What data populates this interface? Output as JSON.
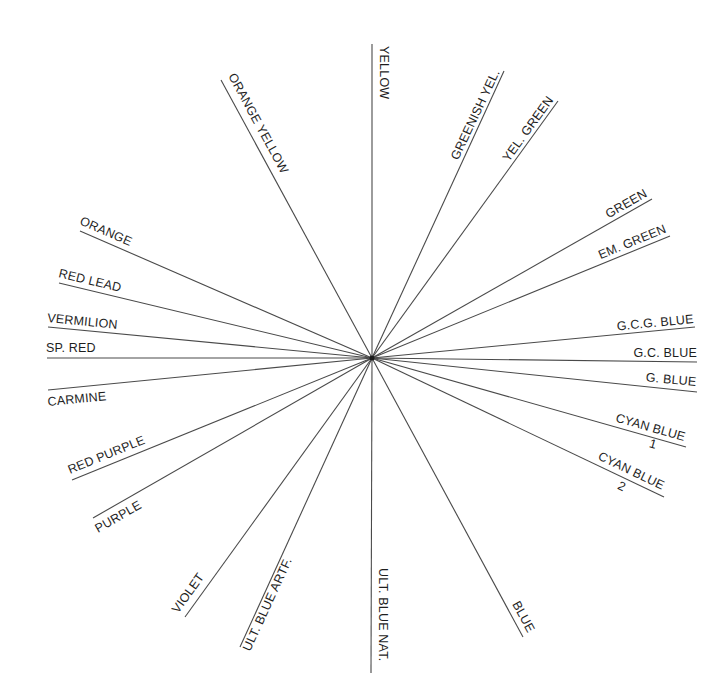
{
  "diagram": {
    "type": "radial color-name diagram",
    "center": {
      "x": 372,
      "y": 358
    },
    "line_color": "#4a4a4a",
    "text_color": "#1e1e1e",
    "rays": [
      {
        "id": "yellow",
        "label": "YELLOW",
        "end": [
          372,
          44
        ],
        "lx": 380,
        "ly": 46,
        "rot": 90,
        "anchor": "start"
      },
      {
        "id": "greenish-yel",
        "label": "GREENISH YEL.",
        "end": [
          504,
          71
        ],
        "lx": 500,
        "ly": 72,
        "rot": -64.7,
        "anchor": "end"
      },
      {
        "id": "yel-green",
        "label": "YEL. GREEN",
        "end": [
          558,
          101
        ],
        "lx": 554,
        "ly": 100,
        "rot": -54.1,
        "anchor": "end"
      },
      {
        "id": "green",
        "label": "GREEN",
        "end": [
          652,
          199
        ],
        "lx": 648,
        "ly": 196,
        "rot": -29.6,
        "anchor": "end"
      },
      {
        "id": "em-green",
        "label": "EM. GREEN",
        "end": [
          670,
          236
        ],
        "lx": 667,
        "ly": 232,
        "rot": -22.3,
        "anchor": "end"
      },
      {
        "id": "gcg-blue",
        "label": "G.C.G. BLUE",
        "end": [
          695,
          327
        ],
        "lx": 694,
        "ly": 323,
        "rot": -5.5,
        "anchor": "end"
      },
      {
        "id": "gc-blue",
        "label": "G.C. BLUE",
        "end": [
          697,
          362
        ],
        "lx": 697,
        "ly": 357,
        "rot": 0,
        "anchor": "end"
      },
      {
        "id": "g-blue",
        "label": "G. BLUE",
        "end": [
          697,
          392
        ],
        "lx": 696,
        "ly": 386,
        "rot": 5.3,
        "anchor": "end"
      },
      {
        "id": "cyan-blue-1",
        "label": "CYAN BLUE",
        "sub": "1",
        "end": [
          686,
          447
        ],
        "lx": 684,
        "ly": 441,
        "rot": 15.8,
        "anchor": "end",
        "subx": 652,
        "suby": 448
      },
      {
        "id": "cyan-blue-2",
        "label": "CYAN BLUE",
        "sub": "2",
        "end": [
          664,
          497
        ],
        "lx": 662,
        "ly": 490,
        "rot": 25.5,
        "anchor": "end",
        "subx": 620,
        "suby": 490
      },
      {
        "id": "blue",
        "label": "BLUE",
        "end": [
          523,
          637
        ],
        "lx": 512,
        "ly": 604,
        "rot": 61.6,
        "anchor": "start"
      },
      {
        "id": "ult-blue-nat",
        "label": "ULT. BLUE NAT.",
        "end": [
          371,
          673
        ],
        "lx": 379,
        "ly": 568,
        "rot": 90,
        "anchor": "start"
      },
      {
        "id": "ult-blue-artf",
        "label": "ULT. BLUE ARTF.",
        "end": [
          240,
          647
        ],
        "lx": 250,
        "ly": 652,
        "rot": -65.4,
        "anchor": "start"
      },
      {
        "id": "violet",
        "label": "VIOLET",
        "end": [
          185,
          617
        ],
        "lx": 178,
        "ly": 614,
        "rot": -54.2,
        "anchor": "start"
      },
      {
        "id": "purple",
        "label": "PURPLE",
        "end": [
          93,
          518
        ],
        "lx": 98,
        "ly": 533,
        "rot": -29.8,
        "anchor": "start"
      },
      {
        "id": "red-purple",
        "label": "RED PURPLE",
        "end": [
          72,
          480
        ],
        "lx": 70,
        "ly": 474,
        "rot": -22.1,
        "anchor": "start"
      },
      {
        "id": "carmine",
        "label": "CARMINE",
        "end": [
          48,
          390
        ],
        "lx": 48,
        "ly": 406,
        "rot": -5.6,
        "anchor": "start"
      },
      {
        "id": "sp-red",
        "label": "SP. RED",
        "end": [
          47,
          358
        ],
        "lx": 46,
        "ly": 352,
        "rot": 0,
        "anchor": "start"
      },
      {
        "id": "vermilion",
        "label": "VERMILION",
        "end": [
          48,
          327
        ],
        "lx": 47,
        "ly": 322,
        "rot": 5.5,
        "anchor": "start"
      },
      {
        "id": "red-lead",
        "label": "RED LEAD",
        "end": [
          59,
          283
        ],
        "lx": 58,
        "ly": 277,
        "rot": 13.5,
        "anchor": "start"
      },
      {
        "id": "orange",
        "label": "ORANGE",
        "end": [
          80,
          231
        ],
        "lx": 79,
        "ly": 224,
        "rot": 23.5,
        "anchor": "start"
      },
      {
        "id": "orange-yellow",
        "label": "ORANGE YELLOW",
        "end": [
          221,
          80
        ],
        "lx": 228,
        "ly": 76,
        "rot": 61.5,
        "anchor": "start"
      }
    ]
  }
}
